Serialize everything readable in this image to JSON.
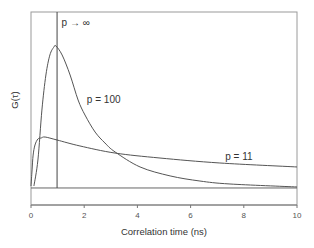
{
  "chart_data": {
    "type": "line",
    "title": "",
    "xlabel": "Correlation time (ns)",
    "ylabel": "G(τ)",
    "xlim": [
      0,
      10
    ],
    "ylim": [
      -0.12,
      1.24
    ],
    "xticks": [
      0,
      2,
      4,
      6,
      8,
      10
    ],
    "xtick_labels": [
      "0",
      "2",
      "4",
      "6",
      "8",
      "10"
    ],
    "yticks": [],
    "grid": false,
    "legend": null,
    "baseline": 0,
    "colors": {
      "line": "#555555",
      "frame": "#999999",
      "axis": "#777777"
    },
    "series": [
      {
        "name": "p = 100",
        "x": [
          0.11,
          0.26,
          0.41,
          0.56,
          0.71,
          0.86,
          0.94,
          1.17,
          1.47,
          1.77,
          2.03,
          2.41,
          2.78,
          3.16,
          4.1,
          5.23,
          6.35,
          7.48,
          10.0
        ],
        "y": [
          0.014,
          0.197,
          0.549,
          0.796,
          0.937,
          0.993,
          1.0,
          0.937,
          0.796,
          0.62,
          0.514,
          0.394,
          0.317,
          0.254,
          0.148,
          0.085,
          0.049,
          0.028,
          0.007
        ]
      },
      {
        "name": "p = 11",
        "x": [
          0.0,
          0.04,
          0.08,
          0.15,
          0.26,
          0.38,
          0.53,
          0.98,
          1.84,
          3.16,
          4.85,
          7.1,
          10.0
        ],
        "y": [
          0.014,
          0.127,
          0.232,
          0.303,
          0.345,
          0.352,
          0.359,
          0.338,
          0.296,
          0.246,
          0.211,
          0.176,
          0.148
        ]
      },
      {
        "name": "p → ∞",
        "type": "vertical-line",
        "x": [
          0.98,
          0.98
        ],
        "y": [
          0,
          1.24
        ]
      }
    ],
    "annotations": [
      {
        "text": "p → ∞",
        "x": 1.15,
        "y": 1.14
      },
      {
        "text": "p = 100",
        "x": 2.1,
        "y": 0.6
      },
      {
        "text": "p = 11",
        "x": 7.3,
        "y": 0.2
      }
    ]
  }
}
